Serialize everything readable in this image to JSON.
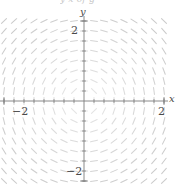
{
  "figure": {
    "kind": "slope-field",
    "clipped_caption_text": "y  x  of  g",
    "background_color": "#ffffff"
  },
  "axes": {
    "x_axis_label": "x",
    "y_axis_label": "y",
    "axis_color": "#7d7d7d",
    "origin_px": {
      "x": 84,
      "y": 101
    },
    "unit_px": 40,
    "xlim": [
      -2.6,
      2.2
    ],
    "ylim": [
      -2.1,
      2.4
    ],
    "x_ticks": [
      {
        "value": -2,
        "label": "−2"
      },
      {
        "value": 2,
        "label": "2"
      }
    ],
    "y_ticks": [
      {
        "value": 2,
        "label": "2"
      },
      {
        "value": -2,
        "label": "−2"
      }
    ],
    "minor_tick_step": 0.25,
    "grid": false
  },
  "chart_data": {
    "type": "scatter",
    "title": "",
    "subtitle": "",
    "xlabel": "x",
    "ylabel": "y",
    "xlim": [
      -2.6,
      2.2
    ],
    "ylim": [
      -2.1,
      2.4
    ],
    "grid": false,
    "legend": null,
    "field": {
      "description": "rotational direction field, slope dy/dx = -x/y (tangent to circles about the origin)",
      "formula": "dy/dx = -x/y",
      "segment_color": "#c9c9c9",
      "segment_length_px": 7,
      "sample_x_min": -2.5,
      "sample_x_max": 2.0,
      "sample_y_min": -2.0,
      "sample_y_max": 2.25,
      "sample_step": 0.25
    },
    "xtick_labels": [
      "−2",
      "2"
    ],
    "ytick_labels": [
      "2",
      "−2"
    ],
    "xtick_values": [
      -2,
      2
    ],
    "ytick_values": [
      2,
      -2
    ]
  }
}
